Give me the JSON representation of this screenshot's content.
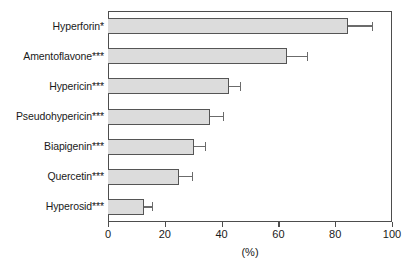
{
  "chart_data": {
    "type": "bar",
    "orientation": "horizontal",
    "title": "",
    "xlabel": "(%)",
    "ylabel": "",
    "xlim": [
      0,
      100
    ],
    "ylim": null,
    "grid": false,
    "legend": null,
    "xticks": [
      0,
      20,
      40,
      60,
      80,
      100
    ],
    "xticklabels": [
      "0",
      "20",
      "40",
      "60",
      "80",
      "100"
    ],
    "categories": [
      "Hyperforin*",
      "Amentoflavone***",
      "Hypericin***",
      "Pseudohypericin***",
      "Biapigenin***",
      "Quercetin***",
      "Hyperosid***"
    ],
    "values": [
      84.5,
      63.0,
      42.5,
      36.0,
      30.3,
      25.0,
      12.7
    ],
    "errors": [
      8.5,
      7.0,
      4.0,
      4.5,
      3.7,
      4.5,
      2.8
    ],
    "bar_fill_color": "#dcdcdc",
    "bar_edge_color": "#555555",
    "error_color": "#6b6b6b",
    "axis_color": "#4d4d4d"
  }
}
